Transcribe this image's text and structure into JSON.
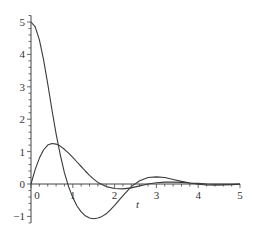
{
  "chart_data": {
    "type": "line",
    "title": "",
    "xlabel": "t",
    "ylabel": "",
    "xlim": [
      0,
      5
    ],
    "ylim": [
      -1.2,
      5.2
    ],
    "grid": false,
    "legend": null,
    "x_ticks": [
      "0",
      "1",
      "2",
      "3",
      "4",
      "5"
    ],
    "y_ticks": [
      "-1",
      "0",
      "1",
      "2",
      "3",
      "4",
      "5"
    ],
    "series": [
      {
        "name": "curve-1",
        "x": [
          0,
          0.1,
          0.2,
          0.3,
          0.4,
          0.5,
          0.6,
          0.7,
          0.8,
          0.9,
          1.0,
          1.1,
          1.2,
          1.3,
          1.4,
          1.5,
          1.6,
          1.7,
          1.8,
          1.9,
          2.0,
          2.2,
          2.4,
          2.6,
          2.8,
          3.0,
          3.2,
          3.4,
          3.6,
          3.8,
          4.0,
          4.2,
          4.4,
          4.6,
          4.8,
          5.0
        ],
        "values": [
          5.0,
          4.85,
          4.45,
          3.85,
          3.1,
          2.3,
          1.55,
          0.9,
          0.35,
          -0.08,
          -0.42,
          -0.68,
          -0.86,
          -0.98,
          -1.05,
          -1.07,
          -1.05,
          -1.0,
          -0.92,
          -0.8,
          -0.66,
          -0.36,
          -0.08,
          0.1,
          0.2,
          0.22,
          0.2,
          0.14,
          0.08,
          0.03,
          -0.01,
          -0.03,
          -0.04,
          -0.03,
          -0.02,
          -0.01
        ]
      },
      {
        "name": "curve-2",
        "x": [
          0,
          0.1,
          0.2,
          0.3,
          0.4,
          0.5,
          0.6,
          0.7,
          0.8,
          0.9,
          1.0,
          1.1,
          1.2,
          1.3,
          1.4,
          1.5,
          1.6,
          1.8,
          2.0,
          2.2,
          2.4,
          2.6,
          2.8,
          3.0,
          3.2,
          3.4,
          3.6,
          3.8,
          4.0,
          4.2,
          4.4,
          4.6,
          4.8,
          5.0
        ],
        "values": [
          0.0,
          0.45,
          0.8,
          1.05,
          1.2,
          1.25,
          1.23,
          1.17,
          1.07,
          0.95,
          0.82,
          0.68,
          0.54,
          0.4,
          0.27,
          0.15,
          0.05,
          -0.08,
          -0.14,
          -0.15,
          -0.12,
          -0.06,
          0.0,
          0.04,
          0.06,
          0.06,
          0.05,
          0.03,
          0.02,
          0.0,
          -0.01,
          -0.01,
          -0.01,
          0.0
        ]
      }
    ]
  }
}
